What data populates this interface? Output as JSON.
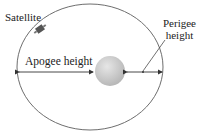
{
  "diagram": {
    "labels": {
      "satellite": "Satellite",
      "apogee": "Apogee height",
      "perigee_line1": "Perigee",
      "perigee_line2": "height"
    },
    "colors": {
      "orbit": "#6e6e6e",
      "earth": "#c8c8c8",
      "text": "#222222"
    }
  }
}
